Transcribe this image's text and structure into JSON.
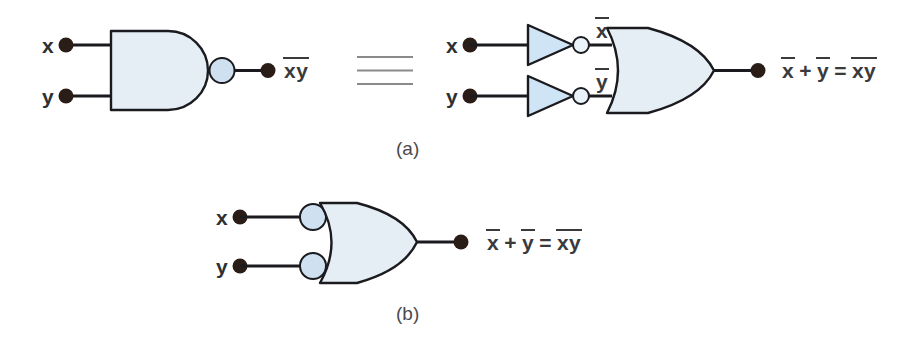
{
  "figure": {
    "background_color": "#ffffff",
    "gate_fill": "#e4eef4",
    "bubble_fill": "#cfe0f0",
    "inverter_fill": "#cfe4f5",
    "stroke_color": "#1b1b1f",
    "dot_color": "#2a1c16",
    "text_color": "#3a3a3c"
  },
  "part_a": {
    "caption": "(a)",
    "nand": {
      "gate_type": "NAND",
      "input_x_label": "x",
      "input_y_label": "y",
      "output_label_term1": "xy",
      "output_label_overline": true
    },
    "equivalence_symbol": "≡",
    "equivalent_circuit": {
      "input_x_label": "x",
      "input_y_label": "y",
      "inverter_x_output_label": "x",
      "inverter_y_output_label": "y",
      "gate_type": "OR",
      "equation": {
        "term1": "x",
        "plus": "+",
        "term2": "y",
        "equals": "=",
        "term3": "xy"
      }
    }
  },
  "part_b": {
    "caption": "(b)",
    "gate": {
      "gate_type": "OR-with-inverted-inputs",
      "input_x_label": "x",
      "input_y_label": "y",
      "bubbles_on_inputs": 2
    },
    "equation": {
      "term1": "x",
      "plus": "+",
      "term2": "y",
      "equals": "=",
      "term3": "xy"
    }
  }
}
